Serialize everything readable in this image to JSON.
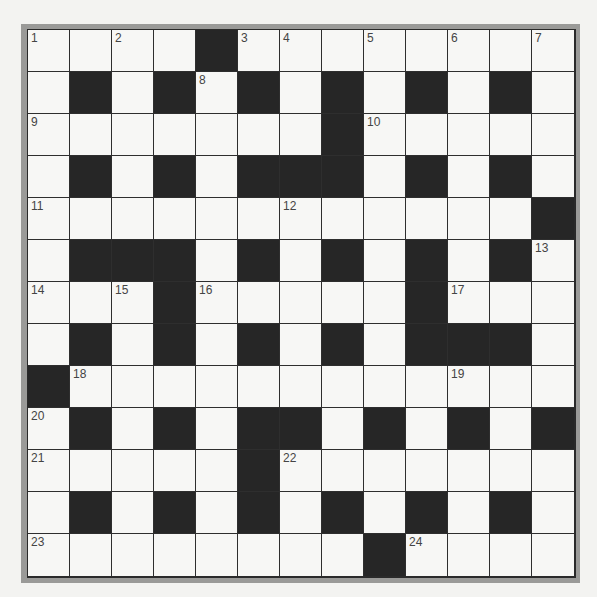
{
  "puzzle": {
    "rows": 13,
    "cols": 13,
    "colors": {
      "frame": "#9a9a98",
      "black_cell": "#262626",
      "white_cell": "#f7f7f5",
      "grid_line": "#2e2e2e",
      "number": "#444444"
    },
    "layout": [
      "....#........",
      ".#.#.#.#.#.#.",
      ".......#.....",
      ".#.#.###.#.#.",
      "............#",
      ".###.#.#.#.#.",
      "...#.....#...",
      ".#.#.#.#.###.",
      "#............",
      ".#.#.##.#.#.#",
      ".....#.......",
      ".#.#.#.#.#.#.",
      "........#...."
    ],
    "numbers": [
      {
        "row": 0,
        "col": 0,
        "n": "1"
      },
      {
        "row": 0,
        "col": 2,
        "n": "2"
      },
      {
        "row": 0,
        "col": 5,
        "n": "3"
      },
      {
        "row": 0,
        "col": 6,
        "n": "4"
      },
      {
        "row": 0,
        "col": 8,
        "n": "5"
      },
      {
        "row": 0,
        "col": 10,
        "n": "6"
      },
      {
        "row": 0,
        "col": 12,
        "n": "7"
      },
      {
        "row": 1,
        "col": 4,
        "n": "8"
      },
      {
        "row": 2,
        "col": 0,
        "n": "9"
      },
      {
        "row": 2,
        "col": 8,
        "n": "10"
      },
      {
        "row": 4,
        "col": 0,
        "n": "11"
      },
      {
        "row": 4,
        "col": 6,
        "n": "12"
      },
      {
        "row": 5,
        "col": 12,
        "n": "13"
      },
      {
        "row": 6,
        "col": 0,
        "n": "14"
      },
      {
        "row": 6,
        "col": 2,
        "n": "15"
      },
      {
        "row": 6,
        "col": 4,
        "n": "16"
      },
      {
        "row": 6,
        "col": 10,
        "n": "17"
      },
      {
        "row": 8,
        "col": 1,
        "n": "18"
      },
      {
        "row": 8,
        "col": 10,
        "n": "19"
      },
      {
        "row": 9,
        "col": 0,
        "n": "20"
      },
      {
        "row": 10,
        "col": 0,
        "n": "21"
      },
      {
        "row": 10,
        "col": 6,
        "n": "22"
      },
      {
        "row": 12,
        "col": 0,
        "n": "23"
      },
      {
        "row": 12,
        "col": 9,
        "n": "24"
      }
    ]
  }
}
